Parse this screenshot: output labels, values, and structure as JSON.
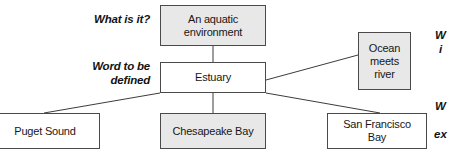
{
  "diagram": {
    "type": "concept-definition-map",
    "canvas": {
      "width": 451,
      "height": 154,
      "background": "#ffffff"
    },
    "colors": {
      "box_fill_gray": "#e8e8e8",
      "box_fill_white": "#ffffff",
      "box_border": "#4a4a4a",
      "connector": "#3c3c3c",
      "text": "#171717"
    },
    "side_labels": [
      {
        "id": "what-is-it",
        "text": "What is it?"
      },
      {
        "id": "word-to-be-defined",
        "line1": "Word to be",
        "line2": "defined"
      }
    ],
    "nodes": [
      {
        "id": "aquatic",
        "role": "category",
        "line1": "An aquatic",
        "line2": "environment",
        "fill": "gray"
      },
      {
        "id": "estuary",
        "role": "word-to-be-defined",
        "line1": "Estuary",
        "fill": "white"
      },
      {
        "id": "ocean",
        "role": "property",
        "line1": "Ocean",
        "line2": "meets",
        "line3": "river",
        "fill": "gray"
      },
      {
        "id": "puget",
        "role": "example",
        "line1": "Puget Sound",
        "fill": "white"
      },
      {
        "id": "chesapeake",
        "role": "example",
        "line1": "Chesapeake Bay",
        "fill": "gray"
      },
      {
        "id": "sanfrancisco",
        "role": "example",
        "line1": "San Francisco",
        "line2": "Bay",
        "fill": "white"
      }
    ],
    "connectors": [
      {
        "from": "estuary",
        "to": "aquatic"
      },
      {
        "from": "estuary",
        "to": "ocean"
      },
      {
        "from": "estuary",
        "to": "puget"
      },
      {
        "from": "estuary",
        "to": "chesapeake"
      },
      {
        "from": "estuary",
        "to": "sanfrancisco"
      }
    ],
    "cropped_right_text": [
      {
        "id": "rtext-1",
        "text": "W"
      },
      {
        "id": "rtext-2",
        "text": "i"
      },
      {
        "id": "rtext-3",
        "text": "W"
      },
      {
        "id": "rtext-4",
        "text": "ex"
      }
    ]
  }
}
